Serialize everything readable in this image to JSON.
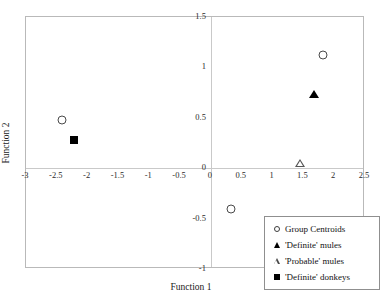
{
  "chart_data": {
    "type": "scatter",
    "title": "",
    "xlabel": "Function 1",
    "ylabel": "Function 2",
    "xlim": [
      -3,
      2.5
    ],
    "ylim": [
      -1,
      1.5
    ],
    "xticks": [
      -3,
      -2.5,
      -2,
      -1.5,
      -1,
      -0.5,
      0,
      0.5,
      1,
      1.5,
      2,
      2.5
    ],
    "xticklabels": [
      "-3",
      "-2.5",
      "-2",
      "-1.5",
      "-1",
      "-0.5",
      "0",
      "0.5",
      "1",
      "1.5",
      "2",
      "2.5"
    ],
    "yticks": [
      -1,
      -0.5,
      0,
      0.5,
      1,
      1.5
    ],
    "yticklabels": [
      "-1",
      "-0.5",
      "0",
      "0.5",
      "1",
      "1.5"
    ],
    "grid": false,
    "legend_position": "bottom-right",
    "series": [
      {
        "name": "Group Centroids",
        "marker": "open-circle",
        "color": "#4a4a4a",
        "points": [
          {
            "x": -2.42,
            "y": 0.48
          },
          {
            "x": 0.33,
            "y": -0.4
          },
          {
            "x": 1.82,
            "y": 1.12
          }
        ]
      },
      {
        "name": "'Definite' mules",
        "marker": "filled-triangle",
        "color": "#000000",
        "points": [
          {
            "x": 1.67,
            "y": 0.74
          }
        ]
      },
      {
        "name": "'Probable' mules",
        "marker": "open-triangle",
        "color": "#4a4a4a",
        "points": [
          {
            "x": 1.45,
            "y": 0.05
          }
        ]
      },
      {
        "name": "'Definite' donkeys",
        "marker": "filled-square",
        "color": "#000000",
        "points": [
          {
            "x": -2.22,
            "y": 0.28
          }
        ]
      }
    ]
  },
  "legend": {
    "items": [
      {
        "label": "Group Centroids",
        "marker": "open-circle"
      },
      {
        "label": "'Definite' mules",
        "marker": "filled-triangle"
      },
      {
        "label": "'Probable' mules",
        "marker": "open-triangle"
      },
      {
        "label": "'Definite' donkeys",
        "marker": "filled-square"
      }
    ]
  }
}
